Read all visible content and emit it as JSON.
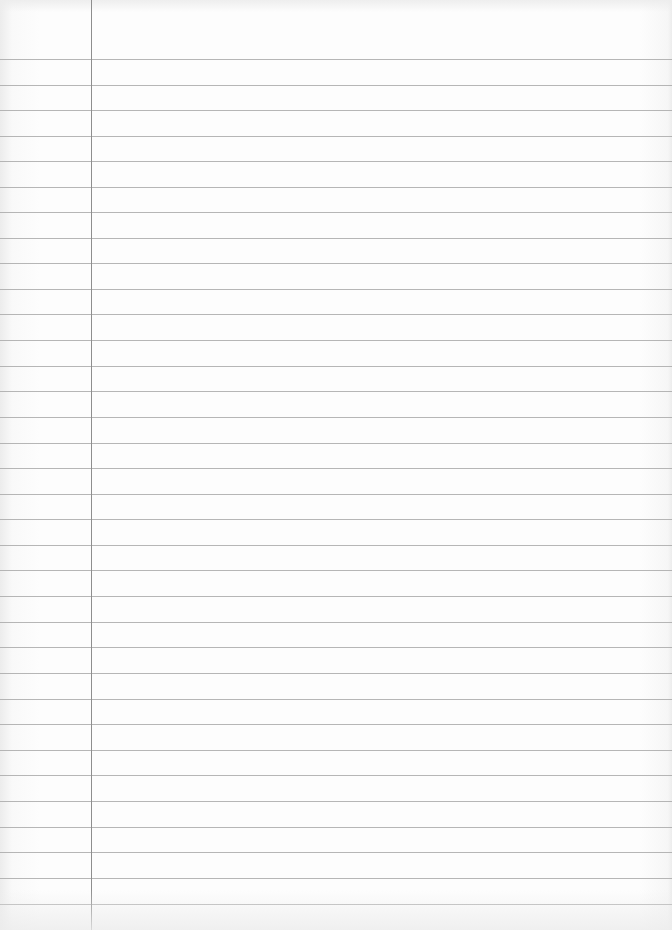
{
  "page": {
    "type": "lined-notebook-paper",
    "content": ""
  },
  "layout": {
    "margin_line_x": 91,
    "rule_color": "#a9a9a9",
    "margin_color": "#8e8e8e",
    "paper_color": "#fdfdfd",
    "rules_y": [
      59,
      85,
      110,
      136,
      161,
      187,
      212,
      238,
      263,
      289,
      314,
      340,
      366,
      391,
      417,
      443,
      468,
      494,
      519,
      545,
      570,
      596,
      622,
      647,
      673,
      699,
      724,
      750,
      775,
      801,
      827,
      852,
      878,
      904
    ]
  }
}
